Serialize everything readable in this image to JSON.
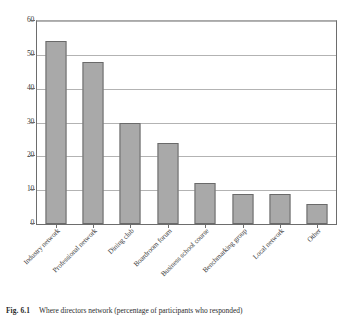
{
  "figure": {
    "caption_label": "Fig. 6.1",
    "caption_text": "Where directors network (percentage of participants who responded)"
  },
  "colors": {
    "bar_fill": "#a9a9a9",
    "bar_border": "#6a6a6a",
    "gridline": "#b3b3b3",
    "axis": "#6d6d6d",
    "background": "#ffffff",
    "text": "#2b2b2b"
  },
  "chart_data": {
    "type": "bar",
    "title": "",
    "subtitle": "",
    "xlabel": "",
    "ylabel": "",
    "ylim": [
      0,
      60
    ],
    "yticks": [
      0,
      10,
      20,
      30,
      40,
      50,
      60
    ],
    "ytick_labels": [
      "0",
      "10",
      "20",
      "30",
      "40",
      "50",
      "60"
    ],
    "grid": true,
    "legend": false,
    "orientation": "vertical",
    "categories": [
      "Industry network",
      "Professional network",
      "Dining club",
      "Boardroom forum",
      "Business school course",
      "Benchmarking group",
      "Local network",
      "Other"
    ],
    "values": [
      54,
      48,
      30,
      24,
      12,
      9,
      9,
      6
    ],
    "series": [
      {
        "name": "Percentage of participants who responded",
        "values": [
          54,
          48,
          30,
          24,
          12,
          9,
          9,
          6
        ]
      }
    ]
  }
}
